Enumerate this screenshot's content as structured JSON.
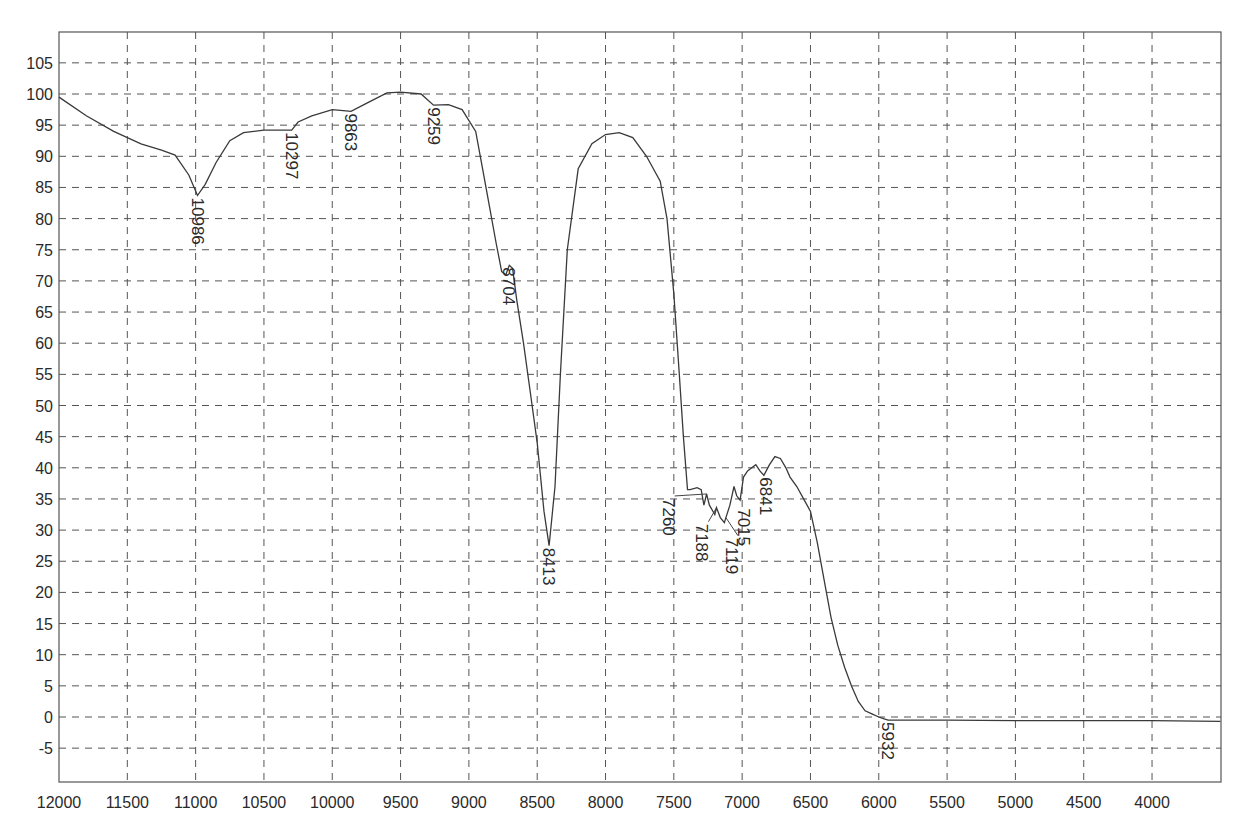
{
  "chart_data": {
    "type": "line",
    "title": "",
    "xlabel": "",
    "ylabel": "",
    "xlim": [
      12000,
      3500
    ],
    "ylim": [
      -10,
      110
    ],
    "x_reversed": true,
    "grid": true,
    "legend": null,
    "x_ticks": [
      12000,
      11500,
      11000,
      10500,
      10000,
      9500,
      9000,
      8500,
      8000,
      7500,
      7000,
      6500,
      6000,
      5500,
      5000,
      4500,
      4000
    ],
    "y_ticks": [
      105,
      100,
      95,
      90,
      85,
      80,
      75,
      70,
      65,
      60,
      55,
      50,
      45,
      40,
      35,
      30,
      25,
      20,
      15,
      10,
      5,
      0,
      -5
    ],
    "series": [
      {
        "name": "spectrum",
        "x": [
          12000,
          11800,
          11600,
          11400,
          11250,
          11150,
          11050,
          10986,
          10930,
          10850,
          10750,
          10650,
          10500,
          10297,
          10250,
          10150,
          10000,
          9900,
          9863,
          9750,
          9600,
          9500,
          9350,
          9259,
          9150,
          9050,
          8950,
          8900,
          8850,
          8800,
          8760,
          8730,
          8704,
          8680,
          8650,
          8600,
          8550,
          8500,
          8450,
          8413,
          8370,
          8330,
          8280,
          8200,
          8100,
          8000,
          7900,
          7800,
          7700,
          7600,
          7550,
          7500,
          7460,
          7430,
          7400,
          7380,
          7330,
          7300,
          7280,
          7260,
          7240,
          7200,
          7188,
          7160,
          7130,
          7119,
          7090,
          7060,
          7040,
          7015,
          6990,
          6960,
          6930,
          6900,
          6870,
          6841,
          6800,
          6760,
          6720,
          6680,
          6650,
          6600,
          6550,
          6500,
          6450,
          6400,
          6350,
          6300,
          6250,
          6200,
          6150,
          6100,
          6050,
          6000,
          5960,
          5932,
          5500,
          5000,
          4500,
          4000,
          3500
        ],
        "y": [
          99.5,
          96.5,
          94,
          92,
          91,
          90.2,
          87,
          83.7,
          85.5,
          89,
          92.5,
          93.8,
          94.2,
          94.2,
          95.5,
          96.5,
          97.5,
          97.3,
          97.2,
          98.5,
          100.2,
          100.3,
          100.0,
          98.2,
          98.3,
          97.5,
          94,
          88,
          82,
          76,
          71.5,
          71,
          72.5,
          72,
          67,
          60,
          52,
          44,
          33,
          27.5,
          37,
          55,
          75,
          88,
          92,
          93.5,
          93.8,
          93,
          90,
          86,
          80,
          68,
          55,
          45,
          36.5,
          36.5,
          36.8,
          36.5,
          34,
          35.8,
          34,
          32.5,
          33.6,
          32,
          31.2,
          32.0,
          34,
          37,
          35.5,
          34.8,
          38.5,
          39.5,
          40,
          40.5,
          39.5,
          38.8,
          40.5,
          41.8,
          41.5,
          40,
          38.5,
          37,
          35,
          33,
          28,
          22,
          16,
          11.5,
          8,
          5,
          2.5,
          1,
          0.5,
          0,
          -0.3,
          -0.5,
          -0.5,
          -0.6,
          -0.6,
          -0.6,
          -0.7
        ]
      }
    ],
    "annotations": [
      {
        "label": "10986",
        "x": 10986,
        "y": 83.7
      },
      {
        "label": "10297",
        "x": 10297,
        "y": 94.2
      },
      {
        "label": "9863",
        "x": 9863,
        "y": 97.2
      },
      {
        "label": "9259",
        "x": 9259,
        "y": 98.2
      },
      {
        "label": "8704",
        "x": 8704,
        "y": 72.5
      },
      {
        "label": "8413",
        "x": 8413,
        "y": 27.5
      },
      {
        "label": "7260",
        "x": 7260,
        "y": 35.8
      },
      {
        "label": "7188",
        "x": 7188,
        "y": 33.6
      },
      {
        "label": "7119",
        "x": 7119,
        "y": 32.0
      },
      {
        "label": "7015",
        "x": 7015,
        "y": 34.8
      },
      {
        "label": "6841",
        "x": 6841,
        "y": 38.8
      },
      {
        "label": "5932",
        "x": 5932,
        "y": -0.5
      }
    ]
  },
  "plot": {
    "left_px": 59,
    "right_px": 1221,
    "top_px": 32,
    "bottom_px": 782,
    "x_origin_value": 12000,
    "x_px_per_unit": 0.13663,
    "y_zero_px": 717,
    "y_px_per_unit": 6.23
  }
}
